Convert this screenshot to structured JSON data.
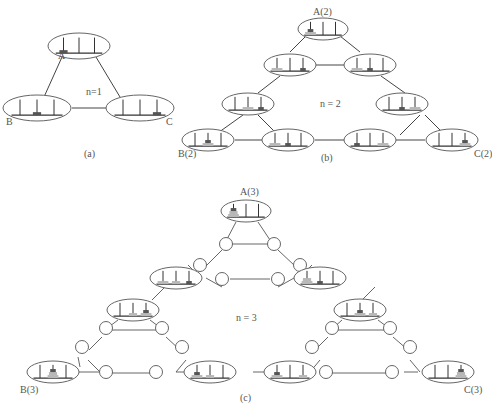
{
  "figure": {
    "panels": [
      {
        "id": "a",
        "caption": "(a)",
        "n_label": "n=1",
        "states": [
          {
            "name": "A",
            "label": "A",
            "cx": 60,
            "cy": 22,
            "pegs": [
              [
                1
              ],
              [],
              []
            ]
          },
          {
            "name": "B",
            "label": "B",
            "cx": 36,
            "cy": 78,
            "pegs": [
              [],
              [
                1
              ],
              []
            ]
          },
          {
            "name": "C",
            "label": "C",
            "cx": 160,
            "cy": 78,
            "pegs": [
              [],
              [],
              [
                1
              ]
            ]
          }
        ]
      },
      {
        "id": "b",
        "caption": "(b)",
        "n_label": "n = 2",
        "corner_labels": [
          "A(2)",
          "B(2)",
          "C(2)"
        ]
      },
      {
        "id": "c",
        "caption": "(c)",
        "n_label": "n = 3",
        "corner_labels": [
          "A(3)",
          "B(3)",
          "C(3)"
        ]
      }
    ]
  },
  "labels": {
    "a_A": "A",
    "a_B": "B",
    "a_C": "C",
    "a_n": "n=1",
    "a_cap": "(a)",
    "b_A": "A(2)",
    "b_B": "B(2)",
    "b_C": "C(2)",
    "b_n": "n = 2",
    "b_cap": "(b)",
    "c_A": "A(3)",
    "c_B": "B(3)",
    "c_C": "C(3)",
    "c_n": "n = 3",
    "c_cap": "(c)"
  },
  "colors": {
    "line": "#444444",
    "ellipse": "#666666",
    "disc_dark": "#555555",
    "disc_light": "#b3b3b3",
    "peg": "#333333"
  }
}
